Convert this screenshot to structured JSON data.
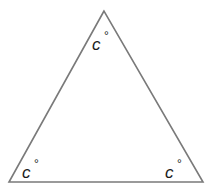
{
  "diagram": {
    "type": "triangle",
    "stroke_color": "#7a7a7a",
    "vertices": {
      "top": [
        104,
        11
      ],
      "bottom_left": [
        9,
        182
      ],
      "bottom_right": [
        203,
        182
      ]
    },
    "angles": [
      {
        "position": "top",
        "variable": "c",
        "unit": "°"
      },
      {
        "position": "bottom_left",
        "variable": "c",
        "unit": "°"
      },
      {
        "position": "bottom_right",
        "variable": "c",
        "unit": "°"
      }
    ]
  }
}
